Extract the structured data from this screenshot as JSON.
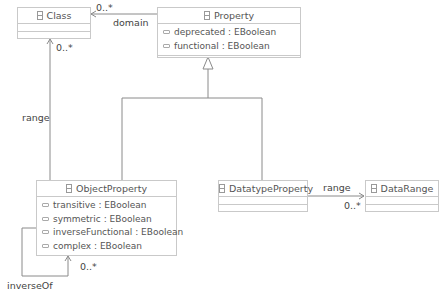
{
  "classes": {
    "class": {
      "name": "Class",
      "attributes": []
    },
    "property": {
      "name": "Property",
      "attributes": [
        {
          "text": "deprecated : EBoolean"
        },
        {
          "text": "functional : EBoolean"
        }
      ]
    },
    "object_property": {
      "name": "ObjectProperty",
      "attributes": [
        {
          "text": "transitive : EBoolean"
        },
        {
          "text": "symmetric : EBoolean"
        },
        {
          "text": "inverseFunctional : EBoolean"
        },
        {
          "text": "complex : EBoolean"
        }
      ]
    },
    "datatype_property": {
      "name": "DatatypeProperty",
      "attributes": []
    },
    "data_range": {
      "name": "DataRange",
      "attributes": []
    }
  },
  "associations": {
    "domain": {
      "role": "domain",
      "multiplicity": "0..*"
    },
    "class_range": {
      "role": "range",
      "multiplicity": "0..*"
    },
    "inverse_of": {
      "role": "inverseOf",
      "multiplicity": "0..*"
    },
    "datatype_range": {
      "role": "range",
      "multiplicity": "0..*"
    }
  },
  "colors": {
    "line": "#8a8a8a",
    "border": "#c9c9c9",
    "text": "#4a4a4a"
  }
}
